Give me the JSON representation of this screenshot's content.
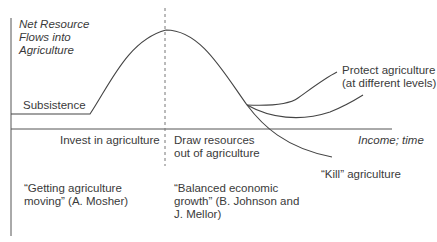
{
  "diagram": {
    "y_axis_label": [
      "Net Resource",
      "Flows into",
      "Agriculture"
    ],
    "x_axis_label": "Income; time",
    "curve_labels": {
      "subsistence": "Subsistence",
      "protect": [
        "Protect agriculture",
        "(at different levels)"
      ],
      "kill": "“Kill” agriculture"
    },
    "phase_labels": {
      "left": "Invest in agriculture",
      "right": [
        "Draw resources",
        "out of agriculture"
      ]
    },
    "quotes": {
      "left": [
        "“Getting agriculture",
        "moving” (A. Mosher)"
      ],
      "right": [
        "“Balanced economic",
        "growth” (B. Johnson and",
        "J. Mellor)"
      ]
    },
    "colors": {
      "line": "#444444",
      "text": "#3a3a3a",
      "background": "#ffffff"
    }
  }
}
